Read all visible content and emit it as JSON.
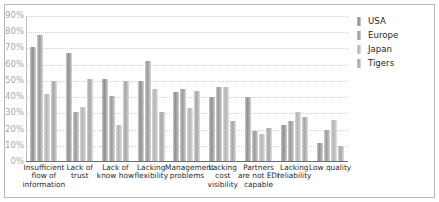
{
  "chart_data": {
    "type": "bar",
    "title": "",
    "xlabel": "",
    "ylabel": "",
    "ylim": [
      0,
      90
    ],
    "grid": true,
    "legend_position": "right",
    "ytick_labels": [
      "90%",
      "80%",
      "70%",
      "60%",
      "50%",
      "40%",
      "30%",
      "20%",
      "10%",
      "0%"
    ],
    "ytick_values": [
      90,
      80,
      70,
      60,
      50,
      40,
      30,
      20,
      10,
      0
    ],
    "categories": [
      "Insufficient flow of information",
      "Lack of trust",
      "Lack of know how",
      "Lacking flexibility",
      "Management problems",
      "Lacking cost visibility",
      "Partners are not EDI capable",
      "Lacking reliability",
      "Low quality"
    ],
    "series": [
      {
        "name": "USA",
        "color": "#8f8f8f",
        "values": [
          71,
          67,
          51,
          50,
          43,
          40,
          40,
          23,
          12
        ]
      },
      {
        "name": "Europe",
        "color": "#9a9a9a",
        "values": [
          78,
          31,
          41,
          62,
          45,
          46,
          19,
          25,
          20
        ]
      },
      {
        "name": "Japan",
        "color": "#b4b4b4",
        "values": [
          42,
          34,
          23,
          45,
          33,
          46,
          17,
          31,
          26
        ]
      },
      {
        "name": "Tigers",
        "color": "#a6a6a6",
        "values": [
          50,
          51,
          50,
          31,
          44,
          25,
          21,
          28,
          10
        ]
      }
    ]
  },
  "legend": {
    "items": [
      {
        "label": "USA"
      },
      {
        "label": "Europe"
      },
      {
        "label": "Japan"
      },
      {
        "label": "Tigers"
      }
    ]
  }
}
